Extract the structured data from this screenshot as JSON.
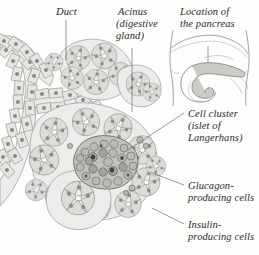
{
  "figure": {
    "background_color": "#fdfdfc",
    "ink_color": "#2b2b2b",
    "line_color": "#8d8d8d",
    "tissue_fill": "#d9d9d6",
    "islet_fill": "#b4b4b0",
    "lumen_fill": "#ffffff",
    "pancreas_fill": "#c9c9c6"
  },
  "labels": {
    "duct": "Duct",
    "acinus_line1": "Acinus",
    "acinus_line2": "(digestive",
    "acinus_line3": "gland)",
    "location_line1": "Location of",
    "location_line2": "the pancreas",
    "islet_line1": "Cell cluster",
    "islet_line2": "(islet of",
    "islet_line3": "Langerhans)",
    "glucagon_line1": "Glucagon-",
    "glucagon_line2": "producing cells",
    "insulin_line1": "Insulin-",
    "insulin_line2": "producing cells"
  },
  "icons": {
    "duct_leader": "leader-line-icon",
    "acinus_leader": "leader-line-icon",
    "location_leader": "leader-line-icon",
    "islet_leader": "leader-line-icon",
    "glucagon_leader": "leader-line-icon",
    "insulin_leader": "leader-line-icon",
    "torso_inset": "torso-outline-icon",
    "pancreas_shape": "pancreas-icon",
    "duct_tree": "duct-branch-icon",
    "acinar_cluster": "acinar-rosette-icon",
    "islet_cluster": "islet-of-langerhans-icon"
  }
}
